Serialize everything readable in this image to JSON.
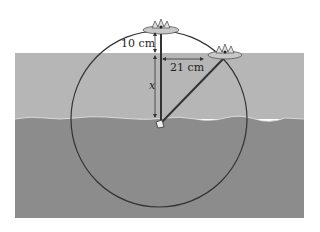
{
  "diagram": {
    "labels": {
      "height_above_water": "10 cm",
      "horizontal_distance": "21 cm",
      "depth_variable": "x"
    },
    "colors": {
      "background": "#ffffff",
      "water": "#b4b4b4",
      "pond_bottom": "#8a8a8a",
      "circle": "#333333",
      "stem": "#333333",
      "lily_leaf": "#c8c8c8"
    },
    "elements": [
      "water-layer",
      "pond-bottom-layer",
      "circle-arc",
      "upright-lily",
      "tilted-lily",
      "vertical-stem",
      "tilted-stem",
      "dimension-10cm",
      "dimension-21cm",
      "dimension-x"
    ]
  }
}
